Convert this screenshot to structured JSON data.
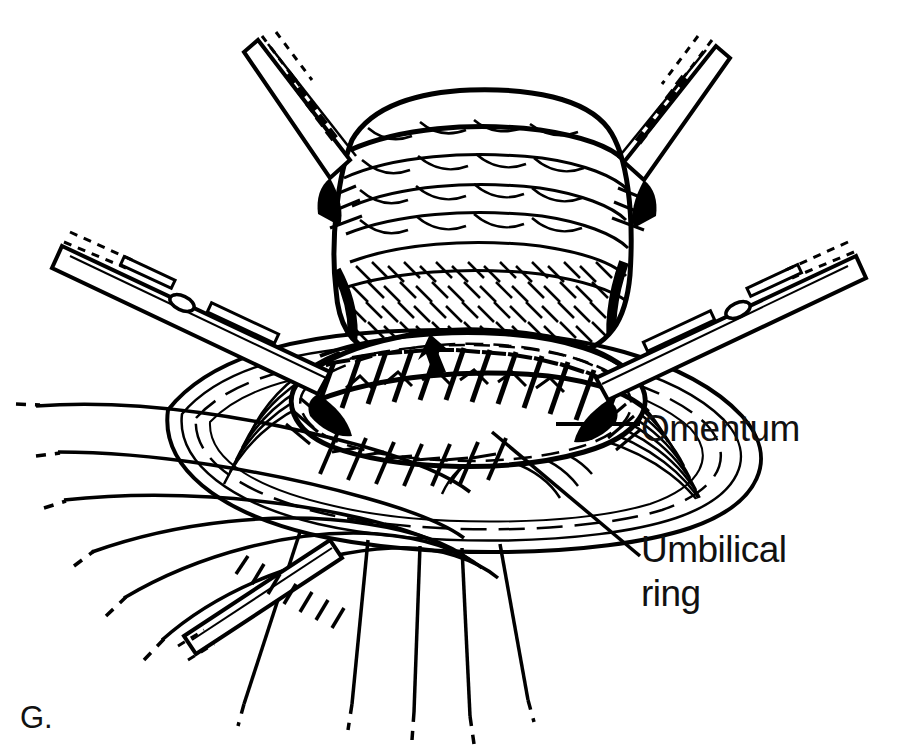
{
  "figure": {
    "letter": "G.",
    "caption_subject": "umbilical hernia repair",
    "background_color": "#ffffff",
    "ink_color": "#000000",
    "width": 917,
    "height": 756
  },
  "labels": [
    {
      "id": "omentum",
      "text": "Omentum",
      "leader": "horizontal",
      "x": 641,
      "y": 407
    },
    {
      "id": "umbilical-ring",
      "text": "Umbilical\nring",
      "line1": "Umbilical",
      "line2": "ring",
      "leader": "diagonal",
      "x": 641,
      "y": 528
    }
  ],
  "annotations": {
    "arrow": {
      "name": "suture-line-arrow",
      "direction": "down",
      "x": 430,
      "y": 345
    }
  },
  "instruments": [
    {
      "id": "clamp-upper-left",
      "type": "hemostat-clamp",
      "side": "upper-left"
    },
    {
      "id": "clamp-upper-right",
      "type": "hemostat-clamp",
      "side": "upper-right"
    },
    {
      "id": "forceps-left",
      "type": "ring-forceps",
      "side": "left"
    },
    {
      "id": "forceps-right",
      "type": "ring-forceps",
      "side": "right"
    }
  ],
  "structures": [
    {
      "id": "omentum-mass",
      "name": "omentum"
    },
    {
      "id": "umbilical-ring",
      "name": "umbilical ring"
    },
    {
      "id": "fascia",
      "name": "abdominal fascia"
    },
    {
      "id": "suture-row",
      "name": "interrupted sutures"
    }
  ]
}
